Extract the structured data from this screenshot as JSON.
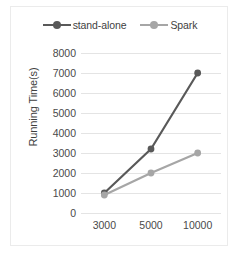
{
  "chart_data": {
    "type": "line",
    "title": "",
    "xlabel": "",
    "ylabel": "Running Time(s)",
    "categories": [
      "3000",
      "5000",
      "10000"
    ],
    "series": [
      {
        "name": "stand-alone",
        "values": [
          1000,
          3200,
          7000
        ],
        "color": "#595959"
      },
      {
        "name": "Spark",
        "values": [
          900,
          2000,
          3000
        ],
        "color": "#a6a6a6"
      }
    ],
    "ylim": [
      0,
      8000
    ],
    "yticks": [
      "0",
      "1000",
      "2000",
      "3000",
      "4000",
      "5000",
      "6000",
      "7000",
      "8000"
    ],
    "ytick_values": [
      0,
      1000,
      2000,
      3000,
      4000,
      5000,
      6000,
      7000,
      8000
    ],
    "grid": true,
    "legend_position": "top",
    "marker": "circle"
  },
  "legend": {
    "entries": [
      {
        "label": "stand-alone",
        "color": "#595959"
      },
      {
        "label": "Spark",
        "color": "#a6a6a6"
      }
    ]
  },
  "axes": {
    "y_title": "Running Time(s)"
  }
}
